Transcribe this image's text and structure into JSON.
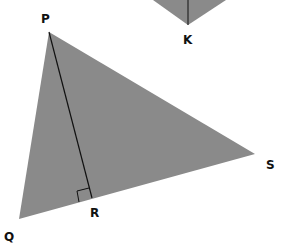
{
  "diagram": {
    "fill_color": "#8a8a8a",
    "line_color": "#111111",
    "top_shape": {
      "vertex_label": "K",
      "points": [
        [
          153,
          0
        ],
        [
          188,
          25
        ],
        [
          226,
          0
        ]
      ],
      "altitude": [
        [
          188,
          0
        ],
        [
          188,
          25
        ]
      ],
      "label_pos": [
        183,
        44
      ]
    },
    "triangle": {
      "vertices": {
        "P": [
          49,
          32
        ],
        "Q": [
          19,
          219
        ],
        "S": [
          255,
          154
        ]
      },
      "foot": {
        "R": [
          92,
          198
        ]
      },
      "segment": "PR",
      "right_angle_at": "R",
      "labels": [
        {
          "text": "P",
          "x": 41,
          "y": 23
        },
        {
          "text": "Q",
          "x": 4,
          "y": 241
        },
        {
          "text": "R",
          "x": 90,
          "y": 217
        },
        {
          "text": "S",
          "x": 266,
          "y": 169
        }
      ]
    }
  }
}
